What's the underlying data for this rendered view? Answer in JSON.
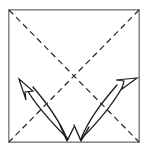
{
  "figure": {
    "caption": "Square sheet with both diagonals creased and four motion arrows",
    "background_color": "#ffffff",
    "width": 147,
    "height": 151
  },
  "paper": {
    "label": "square sheet",
    "shape": "square",
    "stroke_color": "#8a8a8a",
    "fill_color": "#ffffff",
    "left": 8,
    "top": 9,
    "right": 140,
    "bottom": 143
  },
  "fold_lines": [
    {
      "name": "diagonal-crease-tl-br",
      "style": "dashed",
      "meaning": "crease line",
      "color": "#2b2b2b",
      "dash_pattern": "6 4",
      "x1": 9,
      "y1": 10,
      "x2": 139,
      "y2": 142
    },
    {
      "name": "diagonal-crease-tr-bl",
      "style": "dashed",
      "meaning": "crease line",
      "color": "#2b2b2b",
      "dash_pattern": "6 4",
      "x1": 139,
      "y1": 10,
      "x2": 9,
      "y2": 142
    }
  ],
  "crease_intersection": {
    "name": "center-point",
    "x": 74,
    "y": 76
  },
  "arrows": [
    {
      "name": "curved-arrow-up-left",
      "style": "curved",
      "head": "hollow-triangle",
      "direction": "up-left",
      "color": "#1c1c1c",
      "path": "M 68 139 C 55 126, 36 107, 25 87",
      "head_points": "25,80 36,94 27,93 26,101"
    },
    {
      "name": "curved-arrow-up-right",
      "style": "curved",
      "head": "hollow-triangle",
      "direction": "up-right",
      "color": "#1c1c1c",
      "path": "M 81 139 C 94 126, 113 105, 124 85",
      "head_points": "135,78 121,89 123,81 115,80"
    },
    {
      "name": "down-arrow-left",
      "style": "curved",
      "head": "open-barb",
      "direction": "down",
      "color": "#1c1c1c",
      "path": "M 32 86 C 44 100, 58 118, 67 140",
      "head_points": "61,126 67,141 75,128"
    },
    {
      "name": "down-arrow-right",
      "style": "curved",
      "head": "open-barb",
      "direction": "down",
      "color": "#1c1c1c",
      "path": "M 118 84 C 106 98, 90 117, 81 140",
      "head_points": "75,126 81,141 89,128"
    }
  ]
}
